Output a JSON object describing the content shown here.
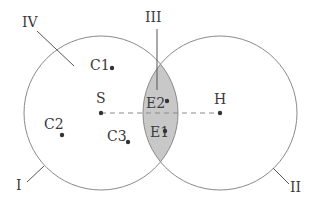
{
  "diagram": {
    "regions": {
      "I": "I",
      "II": "II",
      "III": "III",
      "IV": "IV"
    },
    "points": {
      "S": "S",
      "H": "H",
      "C1": "C1",
      "C2": "C2",
      "C3": "C3",
      "E1": "E1",
      "E2": "E2"
    },
    "colors": {
      "stroke": "#8a8a8a",
      "overlap_fill": "#c8c8c8",
      "text": "#3a3a3a"
    }
  }
}
